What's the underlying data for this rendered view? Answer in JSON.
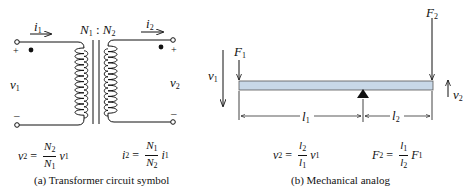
{
  "figure": {
    "panel_a": {
      "caption": "(a) Transformer circuit symbol",
      "turns_ratio": {
        "n1": "N",
        "n1_sub": "1",
        "sep": " : ",
        "n2": "N",
        "n2_sub": "2"
      },
      "current_in": {
        "sym": "i",
        "sub": "1"
      },
      "current_out": {
        "sym": "i",
        "sub": "2"
      },
      "voltage_in": {
        "sym": "v",
        "sub": "1"
      },
      "voltage_out": {
        "sym": "v",
        "sub": "2"
      },
      "plus": "+",
      "minus": "–",
      "eq_v": {
        "lhs": "v",
        "lhs_sub": "2",
        "eq": "=",
        "num": "N",
        "num_sub": "2",
        "den": "N",
        "den_sub": "1",
        "rhs": "v",
        "rhs_sub": "1"
      },
      "eq_i": {
        "lhs": "i",
        "lhs_sub": "2",
        "eq": "=",
        "num": "N",
        "num_sub": "1",
        "den": "N",
        "den_sub": "2",
        "rhs": "i",
        "rhs_sub": "1"
      }
    },
    "panel_b": {
      "caption": "(b) Mechanical analog",
      "force_in": {
        "sym": "F",
        "sub": "1"
      },
      "force_out": {
        "sym": "F",
        "sub": "2"
      },
      "vel_in": {
        "sym": "v",
        "sub": "1"
      },
      "vel_out": {
        "sym": "v",
        "sub": "2"
      },
      "len_1": {
        "sym": "l",
        "sub": "1"
      },
      "len_2": {
        "sym": "l",
        "sub": "2"
      },
      "eq_v": {
        "lhs": "v",
        "lhs_sub": "2",
        "eq": "=",
        "num": "l",
        "num_sub": "2",
        "den": "l",
        "den_sub": "1",
        "rhs": "v",
        "rhs_sub": "1"
      },
      "eq_f": {
        "lhs": "F",
        "lhs_sub": "2",
        "eq": "=",
        "num": "l",
        "num_sub": "1",
        "den": "l",
        "den_sub": "2",
        "rhs": "F",
        "rhs_sub": "1"
      },
      "beam_color": "#c8d8e8"
    }
  }
}
